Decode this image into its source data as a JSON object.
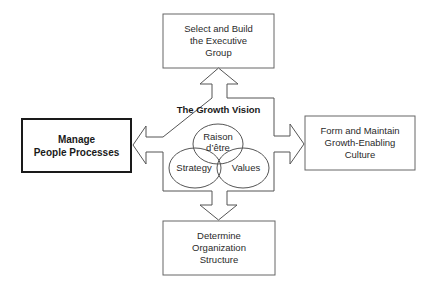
{
  "diagram": {
    "center": {
      "title": "The Growth Vision",
      "circles": [
        {
          "label": "Raison\nd’être"
        },
        {
          "label": "Strategy"
        },
        {
          "label": "Values"
        }
      ]
    },
    "boxes": {
      "top": {
        "label": "Select and Build\nthe Executive\nGroup"
      },
      "left": {
        "label": "Manage\nPeople Processes",
        "emphasized": true
      },
      "right": {
        "label": "Form and Maintain\nGrowth-Enabling\nCulture"
      },
      "bottom": {
        "label": "Determine\nOrganization\nStructure"
      }
    },
    "arrows": [
      "up",
      "left",
      "right",
      "down"
    ],
    "colors": {
      "stroke": "#555555",
      "emphasis_stroke": "#1a1a1a",
      "background": "#ffffff"
    }
  }
}
